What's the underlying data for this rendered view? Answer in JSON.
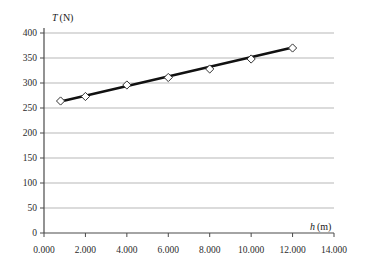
{
  "chart_data": {
    "type": "scatter",
    "title": "",
    "subtitle": "",
    "xlabel": "h (m)",
    "xlabel_var": "h",
    "xlabel_unit": "(m)",
    "ylabel": "T (N)",
    "ylabel_var": "T",
    "ylabel_unit": "(N)",
    "xlim": [
      0,
      14
    ],
    "ylim": [
      0,
      400
    ],
    "grid": "horizontal",
    "legend": "none",
    "x_ticks": [
      "0.000",
      "2.000",
      "4.000",
      "6.000",
      "8.000",
      "10.000",
      "12.000",
      "14.000"
    ],
    "x_tick_values": [
      0,
      2,
      4,
      6,
      8,
      10,
      12,
      14
    ],
    "y_ticks": [
      "0",
      "50",
      "100",
      "150",
      "200",
      "250",
      "300",
      "350",
      "400"
    ],
    "y_tick_values": [
      0,
      50,
      100,
      150,
      200,
      250,
      300,
      350,
      400
    ],
    "series": [
      {
        "name": "measured",
        "marker": "open-diamond",
        "points": [
          {
            "x": 0.8,
            "y": 264
          },
          {
            "x": 2.0,
            "y": 273
          },
          {
            "x": 4.0,
            "y": 296
          },
          {
            "x": 6.0,
            "y": 311
          },
          {
            "x": 8.0,
            "y": 328
          },
          {
            "x": 10.0,
            "y": 348
          },
          {
            "x": 12.0,
            "y": 370
          }
        ]
      },
      {
        "name": "best-fit-line",
        "marker": "none",
        "points": [
          {
            "x": 0.8,
            "y": 263
          },
          {
            "x": 12.0,
            "y": 371
          }
        ]
      }
    ],
    "colors": {
      "line": "#111111",
      "marker_fill": "#ffffff",
      "marker_stroke": "#333333",
      "grid": "#9a9a9a",
      "axis": "#4a4a4a",
      "text": "#1a1a1a",
      "background": "#ffffff"
    }
  }
}
